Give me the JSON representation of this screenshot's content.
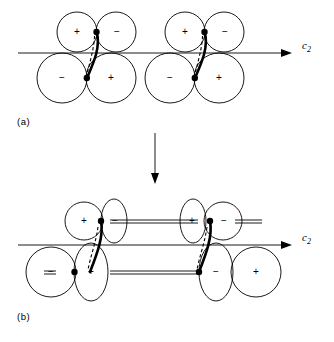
{
  "figure": {
    "title": "",
    "background_color": "#ffffff",
    "line_color": "#000000",
    "width": 334,
    "height": 342
  },
  "panels": [
    {
      "id": "a",
      "label": "(a)",
      "axis": {
        "label": "c",
        "subscript": "2",
        "name": "c2-axis",
        "y": 53,
        "x_start": 18,
        "x_end": 288,
        "arrow": true
      },
      "groups": [
        {
          "name": "orbital-group-a-left",
          "lobes": [
            {
              "sign": "+",
              "shape": "circle",
              "position": "upper-left"
            },
            {
              "sign": "−",
              "shape": "circle",
              "position": "upper-right"
            },
            {
              "sign": "−",
              "shape": "circle",
              "position": "lower-left"
            },
            {
              "sign": "+",
              "shape": "circle",
              "position": "lower-right"
            }
          ],
          "bond": {
            "type": "solid-curve",
            "secondary": "dashed-curve"
          },
          "nodes": 2
        },
        {
          "name": "orbital-group-a-right",
          "lobes": [
            {
              "sign": "+",
              "shape": "circle",
              "position": "upper-left"
            },
            {
              "sign": "−",
              "shape": "circle",
              "position": "upper-right"
            },
            {
              "sign": "−",
              "shape": "circle",
              "position": "lower-left"
            },
            {
              "sign": "+",
              "shape": "circle",
              "position": "lower-right"
            }
          ],
          "bond": {
            "type": "solid-curve",
            "secondary": "dashed-curve"
          },
          "nodes": 2
        }
      ],
      "interchain_links": []
    },
    {
      "id": "b",
      "label": "(b)",
      "axis": {
        "label": "c",
        "subscript": "2",
        "name": "c2-axis",
        "y": 245,
        "x_start": 18,
        "x_end": 288,
        "arrow": true
      },
      "groups": [
        {
          "name": "orbital-group-b-left",
          "lobes": [
            {
              "sign": "+",
              "shape": "circle",
              "position": "upper-left"
            },
            {
              "sign": "−",
              "shape": "ellipse",
              "position": "upper-right"
            },
            {
              "sign": "−",
              "shape": "circle",
              "position": "lower-left"
            },
            {
              "sign": "+",
              "shape": "ellipse",
              "position": "lower-right"
            }
          ],
          "bond": {
            "type": "solid-curve",
            "secondary": "dashed-curve"
          },
          "nodes": 2
        },
        {
          "name": "orbital-group-b-right",
          "lobes": [
            {
              "sign": "+",
              "shape": "ellipse",
              "position": "upper-left"
            },
            {
              "sign": "−",
              "shape": "circle",
              "position": "upper-right"
            },
            {
              "sign": "−",
              "shape": "ellipse",
              "position": "lower-left"
            },
            {
              "sign": "+",
              "shape": "circle",
              "position": "lower-right"
            }
          ],
          "bond": {
            "type": "solid-curve",
            "secondary": "dashed-curve"
          },
          "nodes": 2
        }
      ],
      "interchain_links": [
        {
          "name": "upper-link",
          "y": 221,
          "x_start": 112,
          "x_end": 196
        },
        {
          "name": "lower-link",
          "y": 272,
          "x_start": 112,
          "x_end": 196
        },
        {
          "name": "upper-link-left-stub",
          "y": 221,
          "x_start": 0,
          "x_end": 0
        },
        {
          "name": "lower-link-left-stub",
          "y": 272,
          "x_start": 0,
          "x_end": 0
        }
      ]
    }
  ],
  "transition_arrow": {
    "name": "downward-transition-arrow",
    "x": 155,
    "y_start": 133,
    "y_end": 183
  }
}
